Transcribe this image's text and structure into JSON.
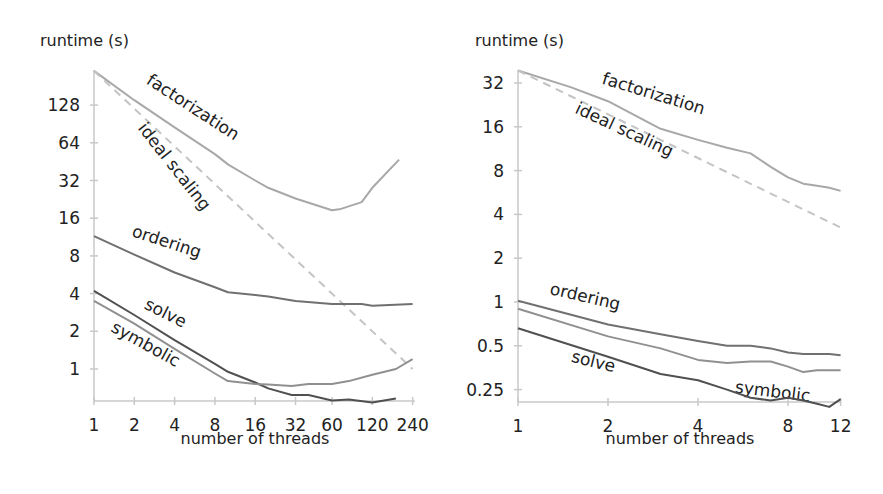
{
  "chart_data": [
    {
      "type": "line",
      "title": "",
      "xlabel": "number of threads",
      "ylabel": "runtime (s)",
      "xscale": "log2",
      "yscale": "log2",
      "xlim": [
        1,
        240
      ],
      "ylim": [
        0.55,
        240
      ],
      "xticks": [
        1,
        2,
        4,
        8,
        16,
        32,
        60,
        120,
        240
      ],
      "xtick_labels": [
        "1",
        "2",
        "4",
        "8",
        "16",
        "32",
        "60",
        "120",
        "240"
      ],
      "yticks": [
        1,
        2,
        4,
        8,
        16,
        32,
        64,
        128
      ],
      "ytick_labels": [
        "1",
        "2",
        "4",
        "8",
        "16",
        "32",
        "64",
        "128"
      ],
      "grid": false,
      "legend": "inline labels",
      "series": [
        {
          "name": "factorization",
          "label": "factorization",
          "color": "#a8a8a8",
          "dashed": false,
          "x": [
            1,
            2,
            4,
            8,
            10,
            16,
            20,
            32,
            60,
            70,
            100,
            120,
            190
          ],
          "y": [
            240,
            140,
            85,
            52,
            43,
            32,
            28,
            23,
            18.5,
            19,
            21.5,
            28,
            47
          ]
        },
        {
          "name": "ideal scaling",
          "label": "ideal scaling",
          "color": "#c4c4c4",
          "dashed": true,
          "x": [
            1,
            240
          ],
          "y": [
            240,
            1
          ]
        },
        {
          "name": "ordering",
          "label": "ordering",
          "color": "#707070",
          "dashed": false,
          "x": [
            1,
            2,
            4,
            8,
            10,
            16,
            20,
            32,
            60,
            100,
            120,
            240
          ],
          "y": [
            11.5,
            8.2,
            5.9,
            4.5,
            4.1,
            3.9,
            3.8,
            3.5,
            3.3,
            3.3,
            3.2,
            3.3
          ]
        },
        {
          "name": "solve",
          "label": "solve",
          "color": "#505050",
          "dashed": false,
          "x": [
            1,
            2,
            4,
            8,
            10,
            16,
            20,
            30,
            40,
            60,
            80,
            120,
            180
          ],
          "y": [
            4.2,
            2.7,
            1.7,
            1.1,
            0.95,
            0.78,
            0.7,
            0.62,
            0.62,
            0.56,
            0.57,
            0.54,
            0.58
          ]
        },
        {
          "name": "symbolic",
          "label": "symbolic",
          "color": "#909090",
          "dashed": false,
          "x": [
            1,
            2,
            4,
            8,
            10,
            16,
            20,
            30,
            40,
            60,
            80,
            120,
            180,
            240
          ],
          "y": [
            3.5,
            2.3,
            1.45,
            0.92,
            0.8,
            0.76,
            0.75,
            0.73,
            0.76,
            0.76,
            0.8,
            0.9,
            1.0,
            1.2
          ]
        }
      ]
    },
    {
      "type": "line",
      "title": "",
      "xlabel": "number of threads",
      "ylabel": "runtime (s)",
      "xscale": "log2",
      "yscale": "log2",
      "xlim": [
        1,
        12
      ],
      "ylim": [
        0.2,
        39
      ],
      "xticks": [
        1,
        2,
        4,
        8,
        12
      ],
      "xtick_labels": [
        "1",
        "2",
        "4",
        "8",
        "12"
      ],
      "yticks": [
        0.25,
        0.5,
        1,
        2,
        4,
        8,
        16,
        32
      ],
      "ytick_labels": [
        "0.25",
        "0.5",
        "1",
        "2",
        "4",
        "8",
        "16",
        "32"
      ],
      "grid": false,
      "legend": "inline labels",
      "series": [
        {
          "name": "factorization",
          "label": "factorization",
          "color": "#a8a8a8",
          "dashed": false,
          "x": [
            1,
            1.5,
            2,
            3,
            4,
            5,
            6,
            7,
            8,
            9,
            10,
            11,
            12
          ],
          "y": [
            39,
            30,
            24,
            15.5,
            13,
            11.5,
            10.5,
            8.5,
            7.2,
            6.5,
            6.3,
            6.1,
            5.8
          ]
        },
        {
          "name": "ideal scaling",
          "label": "ideal scaling",
          "color": "#c4c4c4",
          "dashed": true,
          "x": [
            1,
            12
          ],
          "y": [
            39,
            3.25
          ]
        },
        {
          "name": "ordering",
          "label": "ordering",
          "color": "#707070",
          "dashed": false,
          "x": [
            1,
            2,
            3,
            4,
            5,
            6,
            7,
            8,
            9,
            10,
            11,
            12
          ],
          "y": [
            1.02,
            0.7,
            0.6,
            0.54,
            0.5,
            0.5,
            0.48,
            0.45,
            0.44,
            0.44,
            0.44,
            0.43
          ]
        },
        {
          "name": "symbolic",
          "label": "symbolic",
          "color": "#909090",
          "dashed": false,
          "x": [
            1,
            2,
            3,
            4,
            5,
            6,
            7,
            8,
            9,
            10,
            11,
            12
          ],
          "y": [
            0.9,
            0.58,
            0.48,
            0.4,
            0.38,
            0.39,
            0.39,
            0.36,
            0.33,
            0.34,
            0.34,
            0.34
          ]
        },
        {
          "name": "solve",
          "label": "solve",
          "color": "#505050",
          "dashed": false,
          "x": [
            1,
            2,
            3,
            4,
            5,
            6,
            7,
            8,
            9,
            10,
            11,
            12
          ],
          "y": [
            0.66,
            0.42,
            0.32,
            0.29,
            0.25,
            0.22,
            0.21,
            0.22,
            0.21,
            0.2,
            0.19,
            0.215
          ]
        }
      ]
    }
  ]
}
